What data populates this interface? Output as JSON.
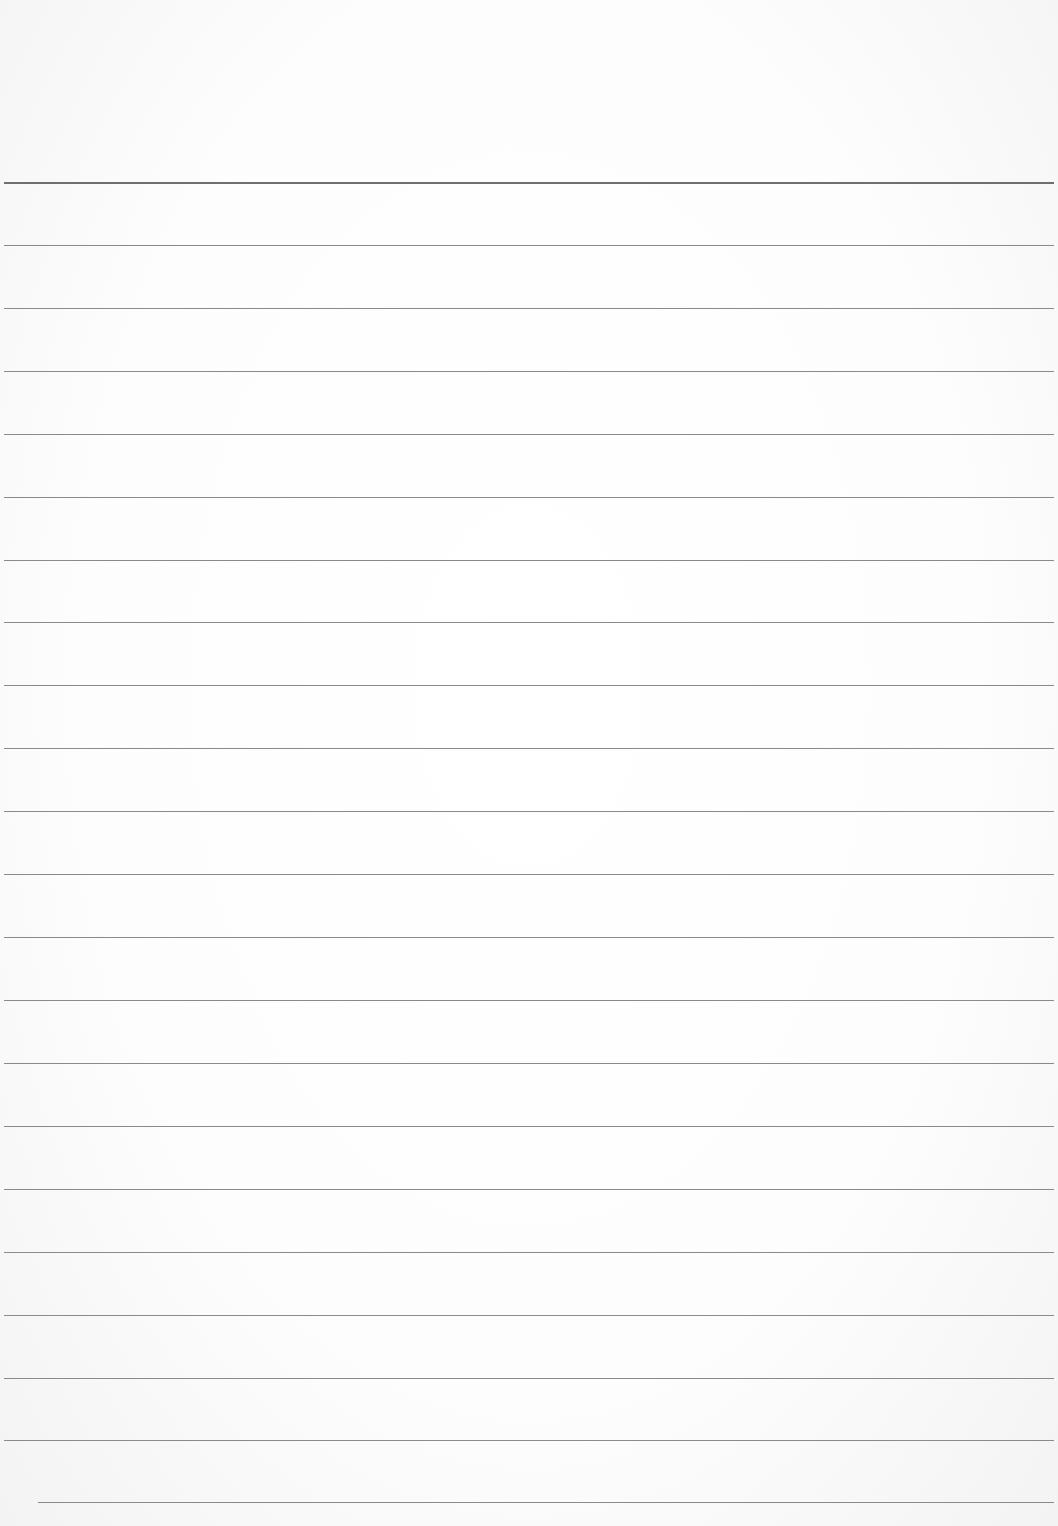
{
  "page": {
    "type": "lined-paper",
    "background_color": "#fcfcfc",
    "rule_color": "#8a8a8a",
    "header_rule_color": "#6f6f6f",
    "rule_count": 22,
    "rule_positions_y": [
      182,
      245,
      308,
      371,
      434,
      497,
      560,
      622,
      685,
      748,
      811,
      874,
      937,
      1000,
      1063,
      1126,
      1189,
      1252,
      1315,
      1378,
      1440,
      1502
    ],
    "text_lines": []
  }
}
